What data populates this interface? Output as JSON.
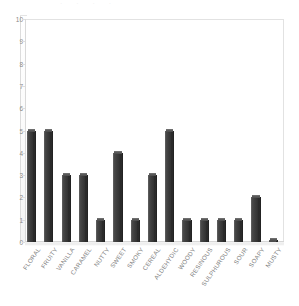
{
  "chart_data": {
    "type": "bar",
    "title": "",
    "subtitle": "",
    "xlabel": "",
    "ylabel": "",
    "ylim": [
      0,
      10
    ],
    "ytick_step": 1,
    "yticks": [
      0,
      1,
      2,
      3,
      4,
      5,
      6,
      7,
      8,
      9,
      10
    ],
    "grid": false,
    "legend": null,
    "legend_position": "none",
    "orientation": "vertical",
    "style": "3d-bar",
    "bar_color": "#3e3e3e",
    "bar_highlight_color": "#6b6b6b",
    "bar_shadow_color": "#262626",
    "plot_background": "#ffffff",
    "axis_color": "#d9d9d9",
    "tick_label_color": "#8a8a8a",
    "category_label_color": "#7f7f7f",
    "category_label_rotation": -55,
    "categories": [
      "FLORAL",
      "FRUITY",
      "VANILLA",
      "CARAMEL",
      "NUTTY",
      "SWEET",
      "SMOKY",
      "CEREAL",
      "ALDEHYDIC",
      "WOODY",
      "RESINOUS",
      "SULPHUROUS",
      "SOUR",
      "SOAPY",
      "MUSTY"
    ],
    "values": [
      5,
      5,
      3,
      3,
      1,
      4,
      1,
      3,
      5,
      1,
      1,
      1,
      1,
      2,
      0
    ]
  },
  "title_remnant": "·   ·    ·     ·"
}
